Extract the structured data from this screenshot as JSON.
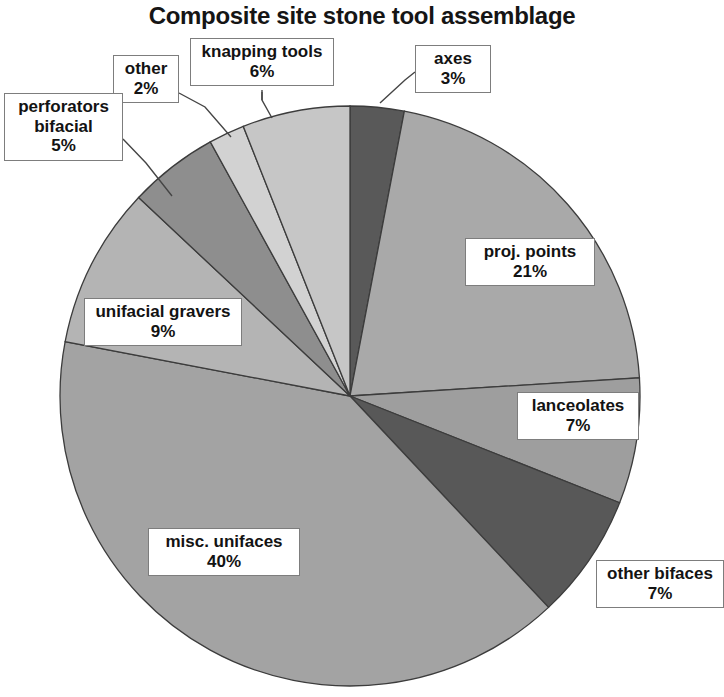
{
  "chart_data": {
    "type": "pie",
    "title": "Composite site stone tool assemblage",
    "xlabel": "",
    "ylabel": "",
    "legend_position": "none",
    "labels_inline": true,
    "units": "percent",
    "categories": [
      "axes",
      "proj. points",
      "lanceolates",
      "other bifaces",
      "misc. unifaces",
      "unifacial gravers",
      "perforators bifacial",
      "other",
      "knapping tools"
    ],
    "values": [
      3,
      21,
      7,
      7,
      40,
      9,
      5,
      2,
      6
    ],
    "start_angle_deg": 0,
    "direction": "clockwise",
    "slices": [
      {
        "name": "axes",
        "value": 3,
        "value_label": "3%",
        "color": "#595959",
        "label_line1": "axes",
        "label_line2": "3%"
      },
      {
        "name": "proj. points",
        "value": 21,
        "value_label": "21%",
        "color": "#a9a9a9",
        "label_line1": "proj. points",
        "label_line2": "21%"
      },
      {
        "name": "lanceolates",
        "value": 7,
        "value_label": "7%",
        "color": "#9e9e9e",
        "label_line1": "lanceolates",
        "label_line2": "7%"
      },
      {
        "name": "other bifaces",
        "value": 7,
        "value_label": "7%",
        "color": "#585858",
        "label_line1": "other bifaces",
        "label_line2": "7%"
      },
      {
        "name": "misc. unifaces",
        "value": 40,
        "value_label": "40%",
        "color": "#a3a3a3",
        "label_line1": "misc. unifaces",
        "label_line2": "40%"
      },
      {
        "name": "unifacial gravers",
        "value": 9,
        "value_label": "9%",
        "color": "#b4b4b4",
        "label_line1": "unifacial gravers",
        "label_line2": "9%"
      },
      {
        "name": "perforators bifacial",
        "value": 5,
        "value_label": "5%",
        "color": "#8e8e8e",
        "label_line1": "perforators",
        "label_line2": "bifacial",
        "label_line3": "5%"
      },
      {
        "name": "other",
        "value": 2,
        "value_label": "2%",
        "color": "#d2d2d2",
        "label_line1": "other",
        "label_line2": "2%"
      },
      {
        "name": "knapping tools",
        "value": 6,
        "value_label": "6%",
        "color": "#c6c6c6",
        "label_line1": "knapping tools",
        "label_line2": "6%"
      }
    ],
    "geometry": {
      "center_x": 350,
      "center_y": 396,
      "radius": 290
    },
    "colors": {
      "dark_gray": "#595959",
      "medium_gray": "#a3a3a3",
      "light_gray": "#c6c6c6",
      "slice_outline": "#3c3c3c",
      "callout_border": "#7d7d7d",
      "text": "#131313",
      "background": "#ffffff"
    }
  },
  "callouts": {
    "other": {
      "name": "other",
      "value": "2%"
    },
    "knapping_tools": {
      "name": "knapping tools",
      "value": "6%"
    },
    "axes": {
      "name": "axes",
      "value": "3%"
    },
    "perforators": {
      "name": "perforators",
      "name2": "bifacial",
      "value": "5%"
    },
    "proj_points": {
      "name": "proj. points",
      "value": "21%"
    },
    "unifacial_gravers": {
      "name": "unifacial gravers",
      "value": "9%"
    },
    "lanceolates": {
      "name": "lanceolates",
      "value": "7%"
    },
    "misc_unifaces": {
      "name": "misc. unifaces",
      "value": "40%"
    },
    "other_bifaces": {
      "name": "other bifaces",
      "value": "7%"
    }
  }
}
